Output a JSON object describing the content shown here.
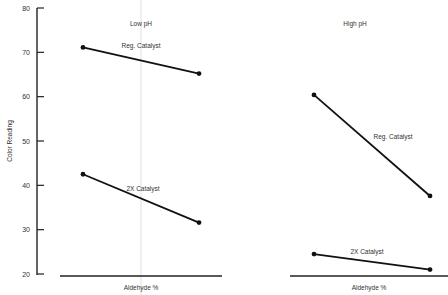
{
  "chart_data": {
    "type": "line",
    "ylabel": "Color Reading",
    "ylim": [
      20,
      80
    ],
    "yticks": [
      20,
      30,
      40,
      50,
      60,
      70,
      80
    ],
    "grid": false,
    "legend": "inline labels",
    "panels": [
      {
        "title": "Low pH",
        "xlabel": "Aldehyde %",
        "x": [
          "low",
          "high"
        ],
        "series": [
          {
            "name": "Reg. Catalyst",
            "values": [
              71.1,
              65.2
            ]
          },
          {
            "name": "2X Catalyst",
            "values": [
              42.5,
              31.6
            ]
          }
        ]
      },
      {
        "title": "High pH",
        "xlabel": "Aldehyde %",
        "x": [
          "low",
          "high"
        ],
        "series": [
          {
            "name": "Reg. Catalyst",
            "values": [
              60.4,
              37.6
            ]
          },
          {
            "name": "2X Catalyst",
            "values": [
              24.5,
              21.0
            ]
          }
        ]
      }
    ]
  },
  "colors": {
    "line": "#111111",
    "axis": "#222222",
    "text": "#333333",
    "divider": "#d8d8d8"
  }
}
